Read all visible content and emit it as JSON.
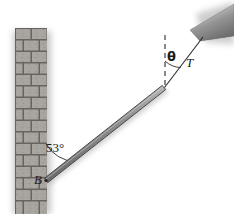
{
  "figure": {
    "width": 234,
    "height": 214,
    "background_color": "#ffffff"
  },
  "labels": {
    "beam_wall_angle": "53°",
    "hinge_point": "B",
    "cable_angle": "θ",
    "cable_tension": "T"
  },
  "colors": {
    "beam_fill": "#8a8a8a",
    "beam_edge": "#3a3a3a",
    "brick_fill": "#b0aca6",
    "brick_mortar": "#6e6a66",
    "wedge_fill": "#8c8c8c",
    "line_stroke": "#2b2b2b",
    "text": "#1a1a1a"
  },
  "geometry": {
    "wall": {
      "x": 15,
      "y": 28,
      "width": 32,
      "height": 186
    },
    "beam": {
      "x1": 46,
      "y1": 180,
      "x2": 164,
      "y2": 87,
      "thickness": 5
    },
    "hinge": {
      "x": 46,
      "y": 180
    },
    "beam_tip": {
      "x": 164,
      "y": 87
    },
    "dashed_vertical": {
      "x": 165,
      "y1": 35,
      "y2": 86
    },
    "cable": {
      "x1": 164,
      "y1": 87,
      "x2": 203,
      "y2": 37
    },
    "ceiling_wedge": {
      "x": 188,
      "y": 8,
      "width": 46,
      "height": 38
    },
    "angle_arc_53": {
      "cx": 46,
      "cy": 180,
      "radius": 36
    },
    "angle_arc_theta": {
      "cx": 165,
      "cy": 86,
      "radius": 26
    }
  }
}
